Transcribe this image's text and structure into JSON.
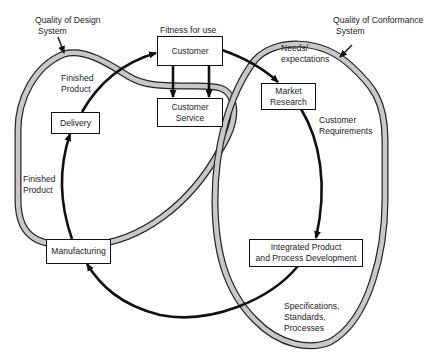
{
  "diagram": {
    "type": "quality-systems-cycle",
    "colors": {
      "loop_fill": "#c8c8c8",
      "loop_outline": "#222222",
      "arrow": "#111111",
      "box_border": "#111111",
      "background": "#ffffff"
    },
    "systems": [
      {
        "id": "design",
        "label_line1": "Quality of Design",
        "label_line2": "System"
      },
      {
        "id": "conformance",
        "label_line1": "Quality of Conformance",
        "label_line2": "System"
      }
    ],
    "nodes": {
      "customer": {
        "label": "Customer",
        "caption": "Fitness for use"
      },
      "customer_service": {
        "line1": "Customer",
        "line2": "Service"
      },
      "market_research": {
        "line1": "Market",
        "line2": "Research"
      },
      "ipd": {
        "line1": "Integrated Product",
        "line2": "and Process Development"
      },
      "manufacturing": {
        "label": "Manufacturing"
      },
      "delivery": {
        "label": "Delivery"
      }
    },
    "flow_labels": {
      "needs": {
        "line1": "Needs/",
        "line2": "expectations"
      },
      "requirements": {
        "line1": "Customer",
        "line2": "Requirements"
      },
      "specs": {
        "line1": "Specifications,",
        "line2": "Standards,",
        "line3": "Processes"
      },
      "finished_upper": {
        "line1": "Finished",
        "line2": "Product"
      },
      "finished_lower": {
        "line1": "Finished",
        "line2": "Product"
      }
    },
    "edges": [
      {
        "from": "Customer",
        "to": "Market Research",
        "label": "Needs/ expectations"
      },
      {
        "from": "Market Research",
        "to": "Integrated Product and Process Development",
        "label": "Customer Requirements"
      },
      {
        "from": "Integrated Product and Process Development",
        "to": "Manufacturing",
        "label": "Specifications, Standards, Processes"
      },
      {
        "from": "Manufacturing",
        "to": "Delivery",
        "label": "Finished Product"
      },
      {
        "from": "Delivery",
        "to": "Customer",
        "label": "Finished Product"
      },
      {
        "from": "Customer",
        "to": "Customer Service",
        "label": ""
      }
    ]
  }
}
